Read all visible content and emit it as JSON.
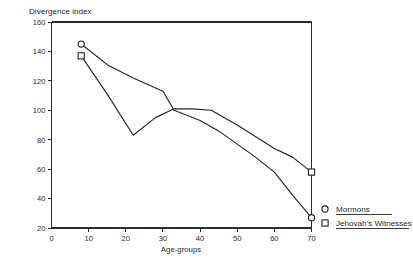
{
  "chart_data": {
    "type": "line",
    "title": "Divergence index",
    "xlabel": "Age-groups",
    "ylabel": "",
    "xlim": [
      0,
      70
    ],
    "ylim": [
      20,
      160
    ],
    "grid": false,
    "legend_position": "right-outside",
    "x_ticks": [
      "0",
      "10",
      "20",
      "30",
      "40",
      "50",
      "60",
      "70"
    ],
    "x_tick_values": [
      0,
      10,
      20,
      30,
      40,
      50,
      60,
      70
    ],
    "y_ticks": [
      "20",
      "40",
      "60",
      "80",
      "100",
      "120",
      "140",
      "160"
    ],
    "y_tick_values": [
      20,
      40,
      60,
      80,
      100,
      120,
      140,
      160
    ],
    "series": [
      {
        "name": "Mormons",
        "marker": "circle",
        "x": [
          8,
          15,
          22,
          30,
          33,
          40,
          45,
          50,
          55,
          60,
          65,
          70
        ],
        "values": [
          145,
          131,
          122,
          113,
          100,
          93,
          86,
          77,
          68,
          58,
          42,
          27
        ]
      },
      {
        "name": "Jehovah's Witnesses",
        "marker": "square",
        "x": [
          8,
          15,
          22,
          28,
          33,
          38,
          43,
          50,
          55,
          60,
          65,
          70
        ],
        "values": [
          137,
          111,
          83,
          95,
          101,
          101,
          100,
          90,
          82,
          74,
          68,
          58
        ]
      }
    ]
  },
  "legend": {
    "entries": [
      {
        "label": "Mormons",
        "marker": "circle"
      },
      {
        "label": "Jehovah's Witnesses",
        "marker": "square"
      }
    ]
  },
  "colors": {
    "line": "#232323",
    "axis": "#2b2b2b",
    "background": "#ffffff"
  }
}
